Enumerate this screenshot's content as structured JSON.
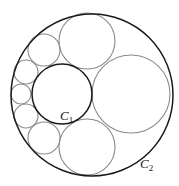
{
  "diagram": {
    "type": "packed-circles",
    "outer_circle": {
      "label": "C",
      "subscript": "2",
      "cx": 92,
      "cy": 95,
      "r": 81
    },
    "main_circle": {
      "label": "C",
      "subscript": "1",
      "cx": 62,
      "cy": 94,
      "r": 30
    },
    "chain_circles": [
      {
        "cx": 131,
        "cy": 94,
        "r": 39
      },
      {
        "cx": 87,
        "cy": 41,
        "r": 28
      },
      {
        "cx": 87,
        "cy": 147,
        "r": 28
      },
      {
        "cx": 44,
        "cy": 50,
        "r": 16
      },
      {
        "cx": 44,
        "cy": 138,
        "r": 16
      },
      {
        "cx": 26,
        "cy": 72,
        "r": 12
      },
      {
        "cx": 26,
        "cy": 116,
        "r": 12
      },
      {
        "cx": 21,
        "cy": 94,
        "r": 10
      }
    ],
    "labels": {
      "c1": {
        "text": "C",
        "sub": "1"
      },
      "c2": {
        "text": "C",
        "sub": "2"
      }
    },
    "colors": {
      "outer_stroke": "#1a1a1a",
      "inner_stroke": "#8a8a8a",
      "background": "#ffffff"
    }
  }
}
